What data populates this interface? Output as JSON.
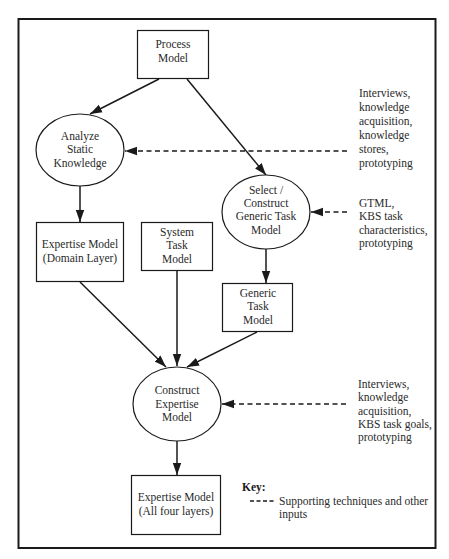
{
  "diagram": {
    "nodes": {
      "process_model": {
        "shape": "rect",
        "lines": [
          "Process",
          "Model"
        ]
      },
      "analyze_static_knowledge": {
        "shape": "ellipse",
        "lines": [
          "Analyze",
          "Static",
          "Knowledge"
        ]
      },
      "select_construct_generic_task_model": {
        "shape": "ellipse",
        "lines": [
          "Select /",
          "Construct",
          "Generic Task",
          "Model"
        ]
      },
      "expertise_model_domain": {
        "shape": "rect",
        "lines": [
          "Expertise Model",
          "(Domain Layer)"
        ]
      },
      "system_task_model": {
        "shape": "rect",
        "lines": [
          "System",
          "Task",
          "Model"
        ]
      },
      "generic_task_model": {
        "shape": "rect",
        "lines": [
          "Generic",
          "Task",
          "Model"
        ]
      },
      "construct_expertise_model": {
        "shape": "ellipse",
        "lines": [
          "Construct",
          "Expertise",
          "Model"
        ]
      },
      "expertise_model_all": {
        "shape": "rect",
        "lines": [
          "Expertise Model",
          "(All four layers)"
        ]
      }
    },
    "inputs": {
      "analyze": {
        "lines": [
          "Interviews,",
          "knowledge",
          "acquisition,",
          "knowledge",
          "stores,",
          "prototyping"
        ]
      },
      "select": {
        "lines": [
          "GTML,",
          "KBS task",
          "characteristics,",
          "prototyping"
        ]
      },
      "construct": {
        "lines": [
          "Interviews,",
          "knowledge",
          "acquisition,",
          "KBS task goals,",
          "prototyping"
        ]
      }
    },
    "edges": [
      {
        "from": "process_model",
        "to": "analyze_static_knowledge",
        "style": "solid"
      },
      {
        "from": "process_model",
        "to": "select_construct_generic_task_model",
        "style": "solid"
      },
      {
        "from": "analyze_static_knowledge",
        "to": "expertise_model_domain",
        "style": "solid"
      },
      {
        "from": "select_construct_generic_task_model",
        "to": "generic_task_model",
        "style": "solid"
      },
      {
        "from": "expertise_model_domain",
        "to": "construct_expertise_model",
        "style": "solid"
      },
      {
        "from": "system_task_model",
        "to": "construct_expertise_model",
        "style": "solid"
      },
      {
        "from": "generic_task_model",
        "to": "construct_expertise_model",
        "style": "solid"
      },
      {
        "from": "construct_expertise_model",
        "to": "expertise_model_all",
        "style": "solid"
      },
      {
        "from": "inputs.analyze",
        "to": "analyze_static_knowledge",
        "style": "dashed"
      },
      {
        "from": "inputs.select",
        "to": "select_construct_generic_task_model",
        "style": "dashed"
      },
      {
        "from": "inputs.construct",
        "to": "construct_expertise_model",
        "style": "dashed"
      }
    ],
    "key": {
      "title": "Key:",
      "entry_lines": [
        "Supporting techniques and other",
        "inputs"
      ]
    },
    "colors": {
      "stroke": "#1a1a1a",
      "text": "#2a2a2a",
      "background": "#ffffff"
    }
  }
}
